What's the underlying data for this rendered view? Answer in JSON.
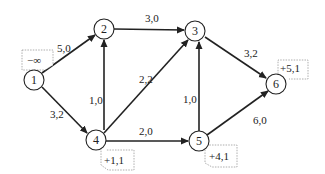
{
  "diagram": {
    "type": "network-flow-graph",
    "nodes": [
      {
        "id": "1",
        "label": "1"
      },
      {
        "id": "2",
        "label": "2"
      },
      {
        "id": "3",
        "label": "3"
      },
      {
        "id": "4",
        "label": "4"
      },
      {
        "id": "5",
        "label": "5"
      },
      {
        "id": "6",
        "label": "6"
      }
    ],
    "edges": [
      {
        "from": "1",
        "to": "2",
        "label": "5,0"
      },
      {
        "from": "1",
        "to": "4",
        "label": "3,2"
      },
      {
        "from": "2",
        "to": "3",
        "label": "3,0"
      },
      {
        "from": "4",
        "to": "2",
        "label": "1,0"
      },
      {
        "from": "4",
        "to": "3",
        "label": "2,2"
      },
      {
        "from": "4",
        "to": "5",
        "label": "2,0"
      },
      {
        "from": "5",
        "to": "3",
        "label": "1,0"
      },
      {
        "from": "3",
        "to": "6",
        "label": "3,2"
      },
      {
        "from": "5",
        "to": "6",
        "label": "6,0"
      }
    ],
    "node_tags": [
      {
        "node": "1",
        "label": "−∞"
      },
      {
        "node": "4",
        "label": "+1,1"
      },
      {
        "node": "5",
        "label": "+4,1"
      },
      {
        "node": "6",
        "label": "+5,1"
      }
    ]
  }
}
